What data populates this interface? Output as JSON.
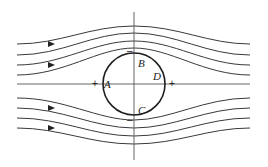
{
  "diagram": {
    "colors": {
      "stroke": "#3a3a3a",
      "cylinder": "#1e1e1e",
      "background": "#ffffff"
    },
    "cylinder": {
      "cx": 134,
      "cy": 84,
      "r": 31
    },
    "axes": {
      "vertical": {
        "x": 134,
        "y1": 12,
        "y2": 160
      },
      "horizontal": {
        "y": 84,
        "x1": 17,
        "x2": 250
      }
    },
    "points": [
      {
        "label": "A",
        "x": 104,
        "y": 88
      },
      {
        "label": "B",
        "x": 138,
        "y": 67
      },
      {
        "label": "C",
        "x": 138,
        "y": 114
      },
      {
        "label": "D",
        "x": 153,
        "y": 80
      }
    ],
    "signs": [
      {
        "label": "+",
        "x": 92,
        "y": 87,
        "meaning": "pressure-positive-left"
      },
      {
        "label": "+",
        "x": 169,
        "y": 87,
        "meaning": "pressure-positive-right"
      },
      {
        "label": "–",
        "x": 127,
        "y": 54,
        "meaning": "pressure-negative-top"
      },
      {
        "label": "–",
        "x": 127,
        "y": 123,
        "meaning": "pressure-negative-bottom"
      }
    ],
    "streamlines": [
      {
        "name": "top-1",
        "d": "M17,44 C60,44 90,26 134,26 C178,26 208,44 250,44",
        "arrow": [
          50,
          44
        ]
      },
      {
        "name": "top-2",
        "d": "M17,55 C62,55 92,33 134,33 C176,33 206,55 250,55",
        "arrow": null
      },
      {
        "name": "top-3",
        "d": "M17,65 C62,65 94,41 134,41 C174,41 206,65 250,65",
        "arrow": [
          50,
          65
        ]
      },
      {
        "name": "top-4",
        "d": "M17,75 C64,75 98,48 134,48 C170,48 204,75 250,75",
        "arrow": null
      },
      {
        "name": "bottom-1",
        "d": "M17,98 C64,98 98,120 134,120 C170,120 204,98 250,98",
        "arrow": null
      },
      {
        "name": "bottom-2",
        "d": "M17,108 C62,108 94,128 134,128 C174,128 206,108 250,108",
        "arrow": [
          50,
          108
        ]
      },
      {
        "name": "bottom-3",
        "d": "M17,118 C62,118 92,136 134,136 C176,136 206,118 250,118",
        "arrow": null
      },
      {
        "name": "bottom-4",
        "d": "M17,128 C60,128 90,144 134,144 C178,144 208,128 250,128",
        "arrow": [
          50,
          128
        ]
      }
    ]
  }
}
